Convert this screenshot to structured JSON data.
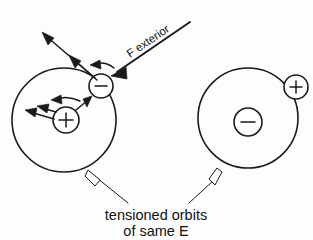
{
  "figure": {
    "title": "tensioned orbits of same E",
    "background_color": "#fdfdfd",
    "ink_color": "#1a1a1a"
  },
  "labels": {
    "force_exterior": "F exterior",
    "caption_line_1": "tensioned orbits",
    "caption_line_2": "of same E"
  },
  "atoms": {
    "left": {
      "name": "left-atom",
      "orbit": {
        "cx": 64,
        "cy": 120,
        "r": 52
      },
      "nucleus": {
        "cx": 66,
        "cy": 120,
        "r": 13,
        "charge": "+"
      },
      "orbiting_particle": {
        "cx": 101,
        "cy": 86,
        "r": 12,
        "charge": "−"
      }
    },
    "right": {
      "name": "right-atom",
      "orbit": {
        "cx": 248,
        "cy": 118,
        "r": 50
      },
      "nucleus": {
        "cx": 248,
        "cy": 122,
        "r": 14,
        "charge": "−"
      },
      "orbiting_particle": {
        "cx": 296,
        "cy": 87,
        "r": 12,
        "charge": "+"
      }
    }
  },
  "vectors": {
    "external_force": {
      "label": "F exterior",
      "direction": "down-left",
      "style": "solid-filled-head"
    },
    "electron_long": {
      "direction": "up-left",
      "style": "solid-filled-head"
    },
    "electron_short": {
      "direction": "up-left",
      "style": "solid-filled-head"
    },
    "electron_curved": {
      "direction": "left",
      "style": "curved"
    },
    "nucleus_long": {
      "direction": "left",
      "style": "solid-filled-head"
    },
    "nucleus_short": {
      "direction": "left",
      "style": "solid-filled-head"
    },
    "nucleus_curved": {
      "direction": "left",
      "style": "curved"
    },
    "attraction": {
      "direction": "up-right",
      "style": "solid-filled-head"
    }
  },
  "callouts": {
    "left_leader": {
      "target": "left-atom-orbit",
      "style": "hollow-arrow"
    },
    "right_leader": {
      "target": "right-atom-orbit",
      "style": "hollow-arrow"
    }
  }
}
